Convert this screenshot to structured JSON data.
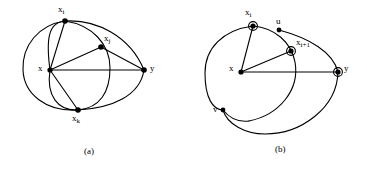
{
  "figure": {
    "background_color": "#ffffff",
    "stroke_color": "#000000",
    "panels": [
      {
        "id": "a",
        "caption": "(a)",
        "caption_pos": {
          "x": 84,
          "y": 146
        },
        "nodes": [
          {
            "id": "x",
            "label": "x",
            "sub": "",
            "x": 50,
            "y": 70,
            "marker": "dot",
            "label_x": 38,
            "label_y": 64
          },
          {
            "id": "xi",
            "label": "x",
            "sub": "i",
            "x": 65,
            "y": 21,
            "marker": "dot",
            "label_x": 58,
            "label_y": 5
          },
          {
            "id": "xj",
            "label": "x",
            "sub": "j",
            "x": 101,
            "y": 47,
            "marker": "dot",
            "label_x": 104,
            "label_y": 34
          },
          {
            "id": "xk",
            "label": "x",
            "sub": "k",
            "x": 78,
            "y": 110,
            "marker": "dot",
            "label_x": 72,
            "label_y": 114
          },
          {
            "id": "y",
            "label": "y",
            "sub": "",
            "x": 144,
            "y": 70,
            "marker": "dot",
            "label_x": 150,
            "label_y": 64
          }
        ],
        "edges": [
          {
            "from": "x",
            "to": "xi"
          },
          {
            "from": "x",
            "to": "xj"
          },
          {
            "from": "x",
            "to": "xk"
          },
          {
            "from": "x",
            "to": "y"
          },
          {
            "from": "xj",
            "to": "y"
          }
        ],
        "arcs": [
          {
            "name": "outer-loop-x-xi-y",
            "d": "M 50 70 C 46 40 48 22 65 21 C 96 19 130 36 144 70"
          },
          {
            "name": "outer-loop-x-xk-y",
            "d": "M 50 70 C 46 96 58 111 78 110 C 112 108 140 96 144 70"
          },
          {
            "name": "inner-circle-left",
            "d": "M 65 21 C 38 25 22 46 23 70 C 24 94 46 112 78 110"
          },
          {
            "name": "inner-circle-right",
            "d": "M 65 21 C 92 25 110 44 110 68 C 110 92 100 108 78 110"
          }
        ]
      },
      {
        "id": "b",
        "caption": "(b)",
        "caption_pos": {
          "x": 92,
          "y": 144
        },
        "nodes": [
          {
            "id": "x",
            "label": "x",
            "sub": "",
            "x": 58,
            "y": 72,
            "marker": "dot",
            "label_x": 46,
            "label_y": 64
          },
          {
            "id": "xi",
            "label": "x",
            "sub": "i",
            "x": 70,
            "y": 26,
            "marker": "circled",
            "label_x": 62,
            "label_y": 8
          },
          {
            "id": "u",
            "label": "u",
            "sub": "",
            "x": 96,
            "y": 30,
            "marker": "dot",
            "label_x": 93,
            "label_y": 17
          },
          {
            "id": "xi1",
            "label": "x",
            "sub": "i+1",
            "x": 108,
            "y": 51,
            "marker": "circled",
            "label_x": 113,
            "label_y": 38
          },
          {
            "id": "y",
            "label": "y",
            "sub": "",
            "x": 155,
            "y": 72,
            "marker": "circled",
            "label_x": 161,
            "label_y": 64
          },
          {
            "id": "v",
            "label": "v",
            "sub": "",
            "x": 40,
            "y": 110,
            "marker": "dot",
            "label_x": 30,
            "label_y": 105
          }
        ],
        "edges": [
          {
            "from": "x",
            "to": "xi"
          },
          {
            "from": "x",
            "to": "xi1"
          },
          {
            "from": "x",
            "to": "y"
          }
        ],
        "arcs": [
          {
            "name": "big-circle",
            "d": "M 70 26 C 40 30 22 48 22 73 C 22 98 30 110 40 110"
          },
          {
            "name": "circle-right-through-u",
            "d": "M 70 26 C 92 28 108 42 112 62 C 117 90 96 115 66 121"
          },
          {
            "name": "arc-u-to-y",
            "d": "M 96 30 C 126 38 150 52 155 72"
          },
          {
            "name": "arc-y-bottom-to-v",
            "d": "M 155 72 C 154 108 118 134 82 134 C 62 134 44 124 40 110"
          },
          {
            "name": "arc-left-lower",
            "d": "M 40 110 C 48 120 58 122 66 121"
          }
        ]
      }
    ]
  }
}
